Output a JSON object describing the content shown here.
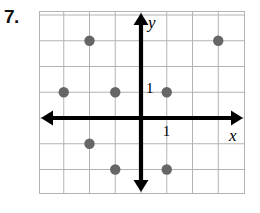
{
  "problem": {
    "number_label": "7."
  },
  "graph": {
    "axis_labels": {
      "x": "x",
      "y": "y"
    },
    "tick_labels": {
      "x_unit": "1",
      "y_unit": "1"
    },
    "colors": {
      "grid_line": "#b3b3b3",
      "axis": "#000000",
      "point": "#666666",
      "background": "#ffffff"
    }
  },
  "chart_data": {
    "type": "scatter",
    "title": "",
    "xlabel": "x",
    "ylabel": "y",
    "xlim": [
      -4,
      4
    ],
    "ylim": [
      -3,
      4
    ],
    "grid": true,
    "legend": false,
    "xticks": [
      1
    ],
    "yticks": [
      1
    ],
    "points": [
      {
        "x": -2,
        "y": 3
      },
      {
        "x": 3,
        "y": 3
      },
      {
        "x": -3,
        "y": 1
      },
      {
        "x": -1,
        "y": 1
      },
      {
        "x": 1,
        "y": 1
      },
      {
        "x": -2,
        "y": -1
      },
      {
        "x": -1,
        "y": -2
      },
      {
        "x": 1,
        "y": -2
      }
    ]
  }
}
